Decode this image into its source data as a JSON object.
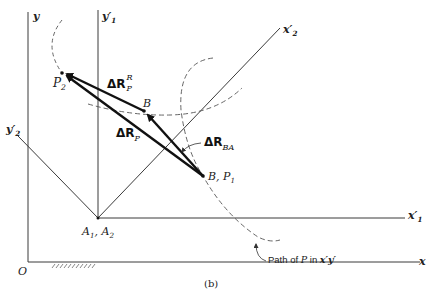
{
  "figure": {
    "caption": "(b)",
    "axes": {
      "y": "y",
      "x": "x",
      "origin": "O",
      "y1_prime": "y",
      "y1_prime_sub": "1",
      "x1_prime": "x",
      "x1_prime_sub": "1",
      "x2_prime": "x",
      "x2_prime_sub": "2",
      "y2_prime": "y",
      "y2_prime_sub": "2",
      "prime_mark": "′"
    },
    "points": {
      "P2": "P",
      "P2_sub": "2",
      "B": "B",
      "B_P1": "B, P",
      "B_P1_sub": "1",
      "A1_A2": "A",
      "A1_sub": "1",
      "A2_sep": ", A",
      "A2_sub": "2"
    },
    "vectors": {
      "delta_R_P_R": "ΔR",
      "delta_R_P_R_sub": "P",
      "delta_R_P_R_sup": "R",
      "delta_R_P": "ΔR",
      "delta_R_P_sub": "P",
      "delta_R_BA": "ΔR",
      "delta_R_BA_sub": "BA"
    },
    "annotations": {
      "path_label_prefix": "Path of ",
      "path_label_P": "P",
      "path_label_mid": " in ",
      "path_label_frame": "x′y′"
    },
    "colors": {
      "line": "#3a3a3a",
      "vector": "#111111",
      "dashed": "#555555"
    }
  }
}
